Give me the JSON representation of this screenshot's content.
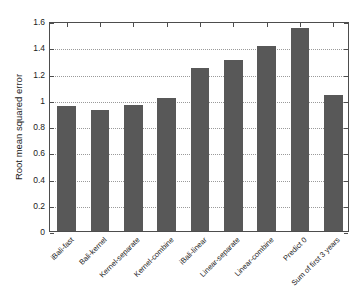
{
  "chart_data": {
    "type": "bar",
    "title": "",
    "xlabel": "",
    "ylabel": "Root mean squared error",
    "ylim": [
      0,
      1.6
    ],
    "yticks": [
      "0",
      "0.2",
      "0.4",
      "0.6",
      "0.8",
      "1",
      "1.2",
      "1.4",
      "1.6"
    ],
    "ytick_values": [
      0,
      0.2,
      0.4,
      0.6,
      0.8,
      1.0,
      1.2,
      1.4,
      1.6
    ],
    "grid": true,
    "legend": "none",
    "bar_color": "#585858",
    "categories": [
      "iBali-fast",
      "Bali-kernel",
      "Kernel-separate",
      "Kernel-combine",
      "iBali-linear",
      "Linear-separate",
      "Linear-combine",
      "Predict 0",
      "Sum of first 3 years"
    ],
    "values": [
      0.95,
      0.92,
      0.96,
      1.01,
      1.24,
      1.3,
      1.41,
      1.55,
      1.04
    ]
  }
}
